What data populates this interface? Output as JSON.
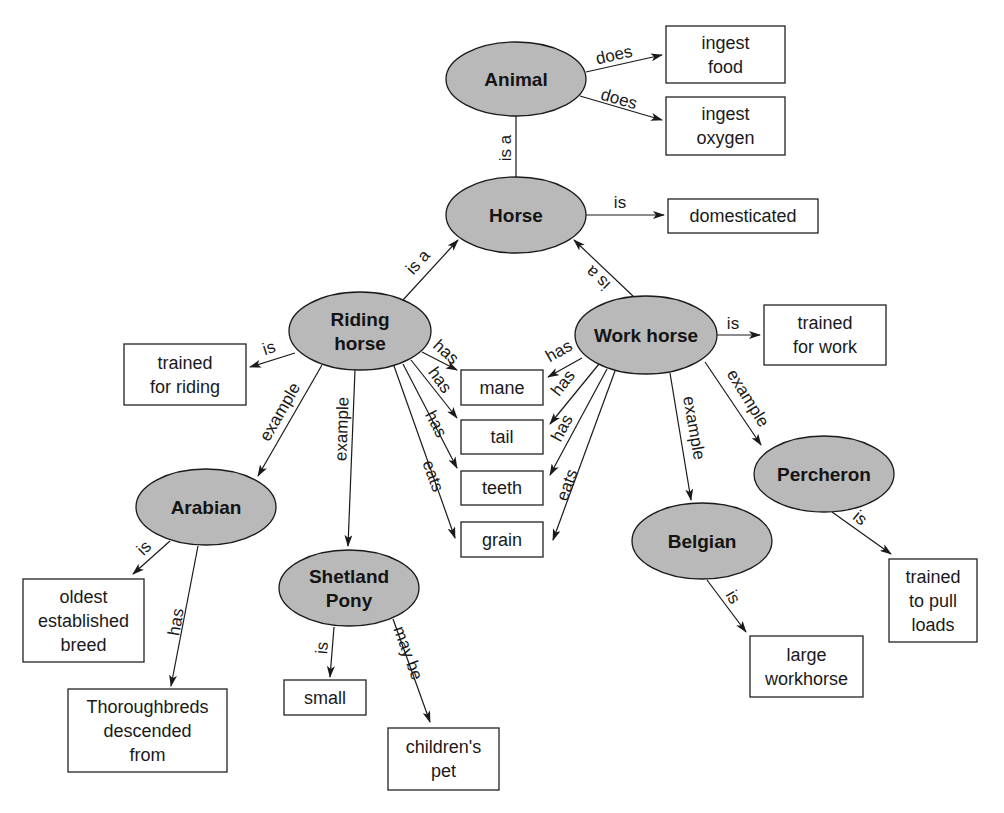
{
  "diagram": {
    "type": "concept-map",
    "colors": {
      "node_fill": "#b9b9b9",
      "stroke": "#1a1a1a",
      "box_fill": "#ffffff"
    },
    "nodes": [
      {
        "id": "animal",
        "lines": [
          "Animal"
        ],
        "cx": 516,
        "cy": 79,
        "rx": 70,
        "ry": 37
      },
      {
        "id": "horse",
        "lines": [
          "Horse"
        ],
        "cx": 516,
        "cy": 215,
        "rx": 70,
        "ry": 38
      },
      {
        "id": "riding-horse",
        "lines": [
          "Riding",
          "horse"
        ],
        "cx": 360,
        "cy": 331,
        "rx": 71,
        "ry": 39
      },
      {
        "id": "work-horse",
        "lines": [
          "Work horse"
        ],
        "cx": 646,
        "cy": 335,
        "rx": 71,
        "ry": 39
      },
      {
        "id": "arabian",
        "lines": [
          "Arabian"
        ],
        "cx": 206,
        "cy": 507,
        "rx": 70,
        "ry": 38
      },
      {
        "id": "shetland-pony",
        "lines": [
          "Shetland",
          "Pony"
        ],
        "cx": 349,
        "cy": 588,
        "rx": 70,
        "ry": 38
      },
      {
        "id": "percheron",
        "lines": [
          "Percheron"
        ],
        "cx": 824,
        "cy": 474,
        "rx": 70,
        "ry": 38
      },
      {
        "id": "belgian",
        "lines": [
          "Belgian"
        ],
        "cx": 702,
        "cy": 541,
        "rx": 70,
        "ry": 38
      }
    ],
    "boxes": [
      {
        "id": "ingest-food",
        "lines": [
          "ingest",
          "food"
        ],
        "x": 666,
        "y": 26,
        "w": 119,
        "h": 57
      },
      {
        "id": "ingest-oxygen",
        "lines": [
          "ingest",
          "oxygen"
        ],
        "x": 666,
        "y": 97,
        "w": 119,
        "h": 58
      },
      {
        "id": "domesticated",
        "lines": [
          "domesticated"
        ],
        "x": 668,
        "y": 199,
        "w": 150,
        "h": 34
      },
      {
        "id": "trained-for-riding",
        "lines": [
          "trained",
          "for riding"
        ],
        "x": 124,
        "y": 344,
        "w": 122,
        "h": 61
      },
      {
        "id": "trained-for-work",
        "lines": [
          "trained",
          "for work"
        ],
        "x": 764,
        "y": 305,
        "w": 122,
        "h": 60
      },
      {
        "id": "mane",
        "lines": [
          "mane"
        ],
        "x": 461,
        "y": 370,
        "w": 82,
        "h": 35
      },
      {
        "id": "tail",
        "lines": [
          "tail"
        ],
        "x": 461,
        "y": 420,
        "w": 82,
        "h": 34
      },
      {
        "id": "teeth",
        "lines": [
          "teeth"
        ],
        "x": 461,
        "y": 471,
        "w": 82,
        "h": 34
      },
      {
        "id": "grain",
        "lines": [
          "grain"
        ],
        "x": 461,
        "y": 522,
        "w": 82,
        "h": 35
      },
      {
        "id": "oldest-established-breed",
        "lines": [
          "oldest",
          "established",
          "breed"
        ],
        "x": 23,
        "y": 579,
        "w": 121,
        "h": 83
      },
      {
        "id": "thoroughbreds-descended-from",
        "lines": [
          "Thoroughbreds",
          "descended",
          "from"
        ],
        "x": 68,
        "y": 689,
        "w": 159,
        "h": 83
      },
      {
        "id": "small",
        "lines": [
          "small"
        ],
        "x": 284,
        "y": 680,
        "w": 82,
        "h": 35
      },
      {
        "id": "childrens-pet",
        "lines": [
          "children's",
          "pet"
        ],
        "x": 388,
        "y": 728,
        "w": 111,
        "h": 62
      },
      {
        "id": "large-workhorse",
        "lines": [
          "large",
          "workhorse"
        ],
        "x": 750,
        "y": 636,
        "w": 113,
        "h": 61
      },
      {
        "id": "trained-to-pull-loads",
        "lines": [
          "trained",
          "to pull",
          "loads"
        ],
        "x": 889,
        "y": 559,
        "w": 88,
        "h": 83
      }
    ],
    "edges": [
      {
        "from": "animal",
        "to": "ingest-food",
        "label": "does",
        "x1": 586,
        "y1": 72,
        "x2": 662,
        "y2": 55,
        "arrow": true,
        "lx": 614,
        "ly": 55,
        "angle": -13
      },
      {
        "from": "animal",
        "to": "ingest-oxygen",
        "label": "does",
        "x1": 580,
        "y1": 96,
        "x2": 662,
        "y2": 120,
        "arrow": true,
        "lx": 619,
        "ly": 99,
        "angle": 16
      },
      {
        "from": "horse",
        "to": "animal",
        "label": "is a",
        "x1": 516,
        "y1": 177,
        "x2": 516,
        "y2": 116,
        "arrow": false,
        "lx": 505,
        "ly": 148,
        "angle": -90
      },
      {
        "from": "horse",
        "to": "domesticated",
        "label": "is",
        "x1": 586,
        "y1": 215,
        "x2": 664,
        "y2": 215,
        "arrow": true,
        "lx": 620,
        "ly": 202,
        "angle": 0
      },
      {
        "from": "riding-horse",
        "to": "horse",
        "label": "is a",
        "x1": 403,
        "y1": 300,
        "x2": 458,
        "y2": 240,
        "arrow": true,
        "lx": 418,
        "ly": 262,
        "angle": -48
      },
      {
        "from": "work-horse",
        "to": "horse",
        "label": "is a",
        "x1": 634,
        "y1": 297,
        "x2": 574,
        "y2": 240,
        "arrow": true,
        "lx": 598,
        "ly": 278,
        "angle": 224
      },
      {
        "from": "riding-horse",
        "to": "trained-for-riding",
        "label": "is",
        "x1": 295,
        "y1": 353,
        "x2": 250,
        "y2": 367,
        "arrow": true,
        "lx": 269,
        "ly": 348,
        "angle": -18
      },
      {
        "from": "work-horse",
        "to": "trained-for-work",
        "label": "is",
        "x1": 717,
        "y1": 335,
        "x2": 760,
        "y2": 335,
        "arrow": true,
        "lx": 733,
        "ly": 323,
        "angle": 0
      },
      {
        "from": "riding-horse",
        "to": "mane",
        "label": "has",
        "x1": 422,
        "y1": 352,
        "x2": 457,
        "y2": 370,
        "arrow": true,
        "lx": 446,
        "ly": 352,
        "angle": 42
      },
      {
        "from": "riding-horse",
        "to": "tail",
        "label": "has",
        "x1": 411,
        "y1": 360,
        "x2": 457,
        "y2": 418,
        "arrow": true,
        "lx": 440,
        "ly": 380,
        "angle": 54
      },
      {
        "from": "riding-horse",
        "to": "teeth",
        "label": "has",
        "x1": 403,
        "y1": 364,
        "x2": 457,
        "y2": 468,
        "arrow": true,
        "lx": 436,
        "ly": 424,
        "angle": 62
      },
      {
        "from": "riding-horse",
        "to": "grain",
        "label": "eats",
        "x1": 394,
        "y1": 366,
        "x2": 455,
        "y2": 538,
        "arrow": true,
        "lx": 433,
        "ly": 476,
        "angle": 70
      },
      {
        "from": "work-horse",
        "to": "mane",
        "label": "has",
        "x1": 582,
        "y1": 358,
        "x2": 548,
        "y2": 377,
        "arrow": true,
        "lx": 559,
        "ly": 351,
        "angle": -30
      },
      {
        "from": "work-horse",
        "to": "tail",
        "label": "has",
        "x1": 599,
        "y1": 364,
        "x2": 550,
        "y2": 424,
        "arrow": true,
        "lx": 563,
        "ly": 383,
        "angle": -52
      },
      {
        "from": "work-horse",
        "to": "teeth",
        "label": "has",
        "x1": 607,
        "y1": 369,
        "x2": 550,
        "y2": 475,
        "arrow": true,
        "lx": 562,
        "ly": 428,
        "angle": -62
      },
      {
        "from": "work-horse",
        "to": "grain",
        "label": "eats",
        "x1": 615,
        "y1": 371,
        "x2": 553,
        "y2": 540,
        "arrow": true,
        "lx": 567,
        "ly": 485,
        "angle": -70
      },
      {
        "from": "riding-horse",
        "to": "arabian",
        "label": "example",
        "x1": 322,
        "y1": 365,
        "x2": 258,
        "y2": 476,
        "arrow": true,
        "lx": 280,
        "ly": 412,
        "angle": -60
      },
      {
        "from": "riding-horse",
        "to": "shetland-pony",
        "label": "example",
        "x1": 355,
        "y1": 370,
        "x2": 348,
        "y2": 546,
        "arrow": true,
        "lx": 342,
        "ly": 429,
        "angle": -88
      },
      {
        "from": "work-horse",
        "to": "belgian",
        "label": "example",
        "x1": 670,
        "y1": 373,
        "x2": 691,
        "y2": 500,
        "arrow": true,
        "lx": 694,
        "ly": 428,
        "angle": 80
      },
      {
        "from": "work-horse",
        "to": "percheron",
        "label": "example",
        "x1": 705,
        "y1": 362,
        "x2": 761,
        "y2": 445,
        "arrow": true,
        "lx": 748,
        "ly": 398,
        "angle": 58
      },
      {
        "from": "arabian",
        "to": "oldest-established-breed",
        "label": "is",
        "x1": 170,
        "y1": 541,
        "x2": 133,
        "y2": 574,
        "arrow": true,
        "lx": 144,
        "ly": 548,
        "angle": -45
      },
      {
        "from": "arabian",
        "to": "thoroughbreds-descended-from",
        "label": "has",
        "x1": 198,
        "y1": 546,
        "x2": 171,
        "y2": 686,
        "arrow": true,
        "lx": 176,
        "ly": 622,
        "angle": -80
      },
      {
        "from": "shetland-pony",
        "to": "small",
        "label": "is",
        "x1": 334,
        "y1": 627,
        "x2": 330,
        "y2": 677,
        "arrow": true,
        "lx": 322,
        "ly": 648,
        "angle": -85
      },
      {
        "from": "shetland-pony",
        "to": "childrens-pet",
        "label": "may be",
        "x1": 393,
        "y1": 619,
        "x2": 430,
        "y2": 722,
        "arrow": true,
        "lx": 408,
        "ly": 653,
        "angle": 70
      },
      {
        "from": "percheron",
        "to": "trained-to-pull-loads",
        "label": "is",
        "x1": 832,
        "y1": 512,
        "x2": 891,
        "y2": 554,
        "arrow": true,
        "lx": 860,
        "ly": 518,
        "angle": 40
      },
      {
        "from": "belgian",
        "to": "large-workhorse",
        "label": "is",
        "x1": 707,
        "y1": 580,
        "x2": 746,
        "y2": 632,
        "arrow": true,
        "lx": 733,
        "ly": 597,
        "angle": 60
      }
    ]
  }
}
